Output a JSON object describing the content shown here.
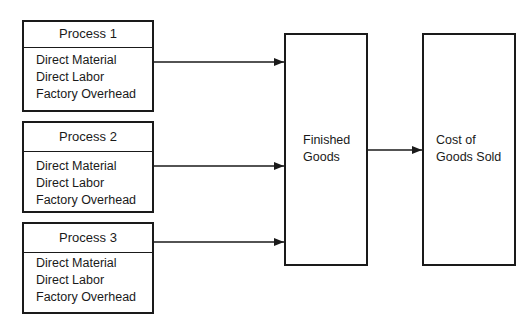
{
  "processes": [
    {
      "title": "Process 1",
      "items": [
        "Direct Material",
        "Direct Labor",
        "Factory Overhead"
      ]
    },
    {
      "title": "Process 2",
      "items": [
        "Direct Material",
        "Direct Labor",
        "Factory Overhead"
      ]
    },
    {
      "title": "Process 3",
      "items": [
        "Direct Material",
        "Direct Labor",
        "Factory Overhead"
      ]
    }
  ],
  "finished_goods": {
    "line1": "Finished",
    "line2": "Goods"
  },
  "cost_of_goods_sold": {
    "line1": "Cost of",
    "line2": "Goods Sold"
  },
  "colors": {
    "line": "#1a1a1a",
    "background": "#ffffff"
  }
}
